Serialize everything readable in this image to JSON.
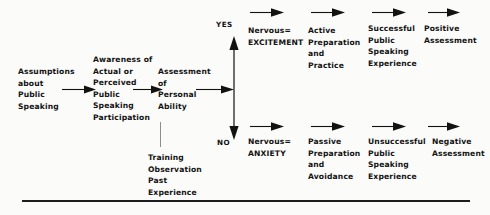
{
  "diagram": {
    "background_color": "#fbfbfa",
    "ink_color": "#121212",
    "nodes": {
      "assumptions": "Assumptions\nabout\nPublic\nSpeaking",
      "awareness": "Awareness of\nActual or\nPerceived\nPublic\nSpeaking\nParticipation",
      "assessment": "Assessment\nof\nPersonal\nAbility",
      "training": "Training\nObservation\nPast\n  Experience",
      "yes_label": "YES",
      "no_label": "NO",
      "yes_nervous": "Nervous=\nEXCITEMENT",
      "yes_preparation": "Active\nPreparation\nand\nPractice",
      "yes_experience": "Successful\nPublic\nSpeaking\nExperience",
      "yes_outcome": "Positive\nAssessment",
      "no_nervous": "Nervous=\nANXIETY",
      "no_preparation": "Passive\nPreparation\nand\nAvoidance",
      "no_experience": "Unsuccessful\nPublic\nSpeaking\nExperience",
      "no_outcome": "Negative\nAssessment"
    },
    "connectors": {
      "arrow_1_name": "arrow-assumptions-to-awareness",
      "arrow_2_name": "arrow-awareness-to-assessment",
      "arrow_3_name": "arrow-assessment-to-decision",
      "decision_arrow_name": "vertical-double-arrow-yes-no",
      "training_connector_name": "training-connector-line",
      "footer_rule_name": "footer-horizontal-rule"
    }
  }
}
